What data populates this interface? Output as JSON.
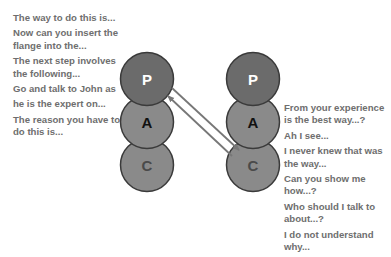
{
  "diagram": {
    "left_ego_states": {
      "circles": [
        {
          "label": "P",
          "fill": "#6b6b6b",
          "label_color": "#ffffff"
        },
        {
          "label": "A",
          "fill": "#8a8a8a",
          "label_color": "#111111"
        },
        {
          "label": "C",
          "fill": "#8a8a8a",
          "label_color": "#4a4a4a"
        }
      ],
      "statements": [
        [
          "The way to do this is..."
        ],
        [
          "Now can you insert the",
          "flange into the..."
        ],
        [
          "The next step involves",
          "the following..."
        ],
        [
          "Go and talk to John as"
        ],
        [
          "he is the expert on..."
        ],
        [
          "The reason you have to",
          "do this is..."
        ]
      ]
    },
    "right_ego_states": {
      "circles": [
        {
          "label": "P",
          "fill": "#6b6b6b",
          "label_color": "#ffffff"
        },
        {
          "label": "A",
          "fill": "#8a8a8a",
          "label_color": "#111111"
        },
        {
          "label": "C",
          "fill": "#8a8a8a",
          "label_color": "#4a4a4a"
        }
      ],
      "statements": [
        [
          "From your experience",
          "is the best way...?"
        ],
        [
          "Ah I see..."
        ],
        [
          "I never knew that was",
          "the way..."
        ],
        [
          "Can you show me",
          "how...?"
        ],
        [
          "Who should I talk to",
          "about...?"
        ],
        [
          "I do not understand",
          "why..."
        ]
      ]
    },
    "transactions": [
      {
        "from": "left.P",
        "to": "right.C",
        "direction": "forward"
      },
      {
        "from": "right.C",
        "to": "left.P",
        "direction": "return"
      }
    ],
    "colors": {
      "text": "#6e6e6e",
      "arrow": "#777777",
      "circle_stroke": "#3a3a3a"
    }
  }
}
